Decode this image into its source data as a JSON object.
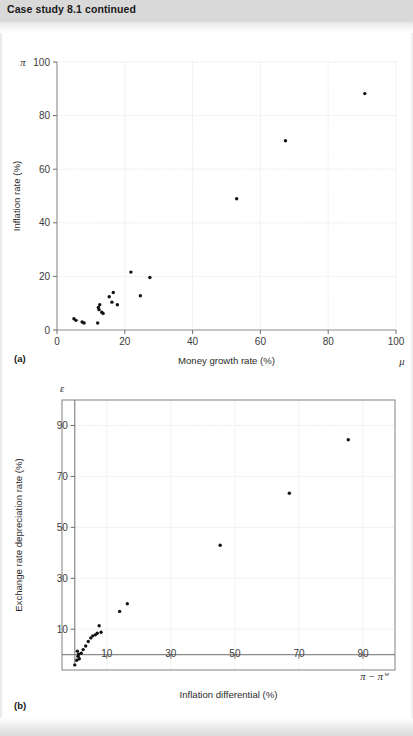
{
  "header": {
    "title": "Case study 8.1 continued"
  },
  "figures": [
    {
      "panel_label": "(a)",
      "y_symbol": "π",
      "x_symbol": "μ",
      "xlabel": "Money growth rate (%)",
      "ylabel": "Inflation rate (%)"
    },
    {
      "panel_label": "(b)",
      "y_symbol": "ε",
      "x_symbol_base": "π − π",
      "x_symbol_sup": "w",
      "xlabel": "Inflation differential (%)",
      "ylabel": "Exchange rate depreciation rate (%)"
    }
  ],
  "chart_data": [
    {
      "type": "scatter",
      "title": "",
      "panel": "(a)",
      "xlabel": "Money growth rate (%)",
      "ylabel": "Inflation rate (%)",
      "x_symbol": "μ",
      "y_symbol": "π",
      "xlim": [
        0,
        100
      ],
      "ylim": [
        0,
        100
      ],
      "xticks": [
        0,
        20,
        40,
        60,
        80,
        100
      ],
      "yticks": [
        0,
        20,
        40,
        60,
        80,
        100
      ],
      "grid": true,
      "legend": null,
      "points": [
        {
          "x": 5.0,
          "y": 4.2
        },
        {
          "x": 5.6,
          "y": 3.6
        },
        {
          "x": 7.4,
          "y": 3.0
        },
        {
          "x": 8.0,
          "y": 2.6
        },
        {
          "x": 12.0,
          "y": 2.6
        },
        {
          "x": 12.2,
          "y": 8.4
        },
        {
          "x": 12.4,
          "y": 7.6
        },
        {
          "x": 12.6,
          "y": 9.4
        },
        {
          "x": 13.2,
          "y": 6.6
        },
        {
          "x": 13.6,
          "y": 6.2
        },
        {
          "x": 15.4,
          "y": 12.4
        },
        {
          "x": 16.2,
          "y": 10.4
        },
        {
          "x": 16.6,
          "y": 14.0
        },
        {
          "x": 17.8,
          "y": 9.4
        },
        {
          "x": 21.8,
          "y": 21.6
        },
        {
          "x": 24.6,
          "y": 12.8
        },
        {
          "x": 27.4,
          "y": 19.6
        },
        {
          "x": 53.0,
          "y": 49.0
        },
        {
          "x": 67.4,
          "y": 70.6
        },
        {
          "x": 90.8,
          "y": 88.2
        }
      ]
    },
    {
      "type": "scatter",
      "title": "",
      "panel": "(b)",
      "xlabel": "Inflation differential (%)",
      "ylabel": "Exchange rate depreciation rate (%)",
      "x_symbol": "π − πᵂ",
      "y_symbol": "ε",
      "xlim": [
        -4,
        100
      ],
      "ylim": [
        -6,
        100
      ],
      "xticks": [
        10,
        30,
        50,
        70,
        90
      ],
      "yticks": [
        10,
        30,
        50,
        70,
        90
      ],
      "grid": true,
      "legend": null,
      "points": [
        {
          "x": 0.0,
          "y": -4.0
        },
        {
          "x": 0.6,
          "y": -2.2
        },
        {
          "x": 0.8,
          "y": 1.4
        },
        {
          "x": 1.0,
          "y": -0.6
        },
        {
          "x": 1.2,
          "y": 0.2
        },
        {
          "x": 1.4,
          "y": -1.6
        },
        {
          "x": 2.0,
          "y": 0.6
        },
        {
          "x": 2.6,
          "y": 2.0
        },
        {
          "x": 3.4,
          "y": 3.4
        },
        {
          "x": 4.2,
          "y": 5.2
        },
        {
          "x": 5.0,
          "y": 6.6
        },
        {
          "x": 5.6,
          "y": 7.4
        },
        {
          "x": 6.4,
          "y": 7.8
        },
        {
          "x": 7.0,
          "y": 8.4
        },
        {
          "x": 7.6,
          "y": 11.4
        },
        {
          "x": 8.2,
          "y": 8.8
        },
        {
          "x": 14.0,
          "y": 17.0
        },
        {
          "x": 16.4,
          "y": 20.0
        },
        {
          "x": 45.4,
          "y": 43.0
        },
        {
          "x": 67.0,
          "y": 63.4
        },
        {
          "x": 85.4,
          "y": 84.4
        }
      ]
    }
  ]
}
